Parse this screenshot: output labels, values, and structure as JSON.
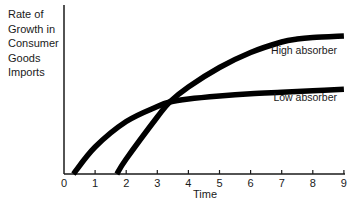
{
  "chart_data": {
    "type": "line",
    "title": "",
    "xlabel": "Time",
    "ylabel_lines": [
      "Rate of",
      "Growth in",
      "Consumer",
      "Goods",
      "Imports"
    ],
    "ylabel": "Rate of Growth in Consumer Goods Imports",
    "x_ticks": [
      "0",
      "1",
      "2",
      "3",
      "4",
      "5",
      "6",
      "7",
      "8",
      "9"
    ],
    "xlim": [
      0,
      9
    ],
    "y_ticks": [],
    "grid": false,
    "legend_position": "inline labels at right end of curves",
    "series": [
      {
        "name": "Low absorber",
        "x": [
          0.3,
          1,
          2,
          3,
          3.4,
          4,
          5,
          6,
          7,
          8,
          9
        ],
        "y": [
          0,
          0.18,
          0.35,
          0.45,
          0.48,
          0.5,
          0.52,
          0.535,
          0.545,
          0.555,
          0.565
        ]
      },
      {
        "name": "High absorber",
        "x": [
          1.7,
          2,
          3,
          3.4,
          4,
          5,
          6,
          7,
          7.5,
          8,
          9
        ],
        "y": [
          0,
          0.1,
          0.38,
          0.48,
          0.58,
          0.71,
          0.81,
          0.88,
          0.9,
          0.91,
          0.92
        ]
      }
    ],
    "annotations": [
      "High absorber",
      "Low absorber"
    ]
  }
}
